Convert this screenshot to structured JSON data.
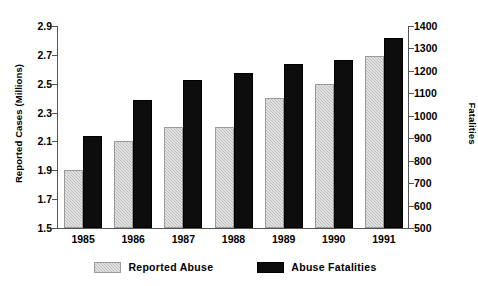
{
  "chart_data": {
    "type": "bar",
    "title": "",
    "subtitle": "",
    "xlabel": "",
    "ylabel": "Reported Cases (Millions)",
    "y2label": "Fatalities",
    "categories": [
      "1985",
      "1986",
      "1987",
      "1988",
      "1989",
      "1990",
      "1991"
    ],
    "series": [
      {
        "name": "Reported Abuse",
        "axis": "left",
        "color": "#bdbdbd",
        "values": [
          1.9,
          2.1,
          2.2,
          2.2,
          2.4,
          2.5,
          2.69
        ]
      },
      {
        "name": "Abuse Fatalities",
        "axis": "right",
        "color": "#0d0d0d",
        "values": [
          910,
          1070,
          1160,
          1190,
          1230,
          1250,
          1345
        ]
      }
    ],
    "ylim": [
      1.5,
      2.9
    ],
    "y2lim": [
      500,
      1400
    ],
    "yticks": [
      "1.5",
      "1.7",
      "1.9",
      "2.1",
      "2.3",
      "2.5",
      "2.7",
      "2.9"
    ],
    "y2ticks": [
      "500",
      "600",
      "700",
      "800",
      "900",
      "1000",
      "1100",
      "1200",
      "1300",
      "1400"
    ],
    "grid": false,
    "legend_position": "bottom"
  },
  "legend": {
    "items": [
      {
        "label": "Reported Abuse",
        "swatch": "reported"
      },
      {
        "label": "Abuse Fatalities",
        "swatch": "fatalities"
      }
    ]
  }
}
